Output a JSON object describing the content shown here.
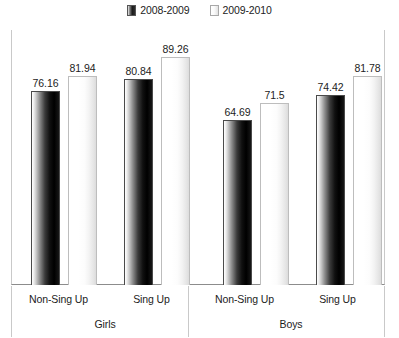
{
  "chart_data": {
    "type": "bar",
    "title": "",
    "subtitle": "",
    "xlabel": "",
    "ylabel": "",
    "grid": false,
    "legend_position": "top-center",
    "ylim": [
      0,
      100
    ],
    "categories": [
      "Non-Sing Up",
      "Sing Up",
      "Non-Sing Up",
      "Sing Up"
    ],
    "group_labels": [
      "Girls",
      "Boys"
    ],
    "series": [
      {
        "name": "2008-2009",
        "color": "#1a1a1a",
        "values": [
          76.16,
          80.84,
          64.69,
          74.42
        ]
      },
      {
        "name": "2009-2010",
        "color": "#f2f2f2",
        "values": [
          81.94,
          89.26,
          71.5,
          81.78
        ]
      }
    ],
    "groups": [
      {
        "label": "Girls",
        "categories": [
          {
            "label": "Non-Sing Up",
            "values": [
              "76.16",
              "81.94"
            ]
          },
          {
            "label": "Sing Up",
            "values": [
              "80.84",
              "89.26"
            ]
          }
        ]
      },
      {
        "label": "Boys",
        "categories": [
          {
            "label": "Non-Sing Up",
            "values": [
              "64.69",
              "71.5"
            ]
          },
          {
            "label": "Sing Up",
            "values": [
              "74.42",
              "81.78"
            ]
          }
        ]
      }
    ]
  },
  "legend": {
    "entries": [
      {
        "label": "2008-2009",
        "swatch": "dark-bar-swatch"
      },
      {
        "label": "2009-2010",
        "swatch": "light-bar-swatch"
      }
    ]
  },
  "bars": [
    {
      "value": "76.16",
      "num": 76.16,
      "series": 0
    },
    {
      "value": "81.94",
      "num": 81.94,
      "series": 1
    },
    {
      "value": "80.84",
      "num": 80.84,
      "series": 0
    },
    {
      "value": "89.26",
      "num": 89.26,
      "series": 1
    },
    {
      "value": "64.69",
      "num": 64.69,
      "series": 0
    },
    {
      "value": "71.5",
      "num": 71.5,
      "series": 1
    },
    {
      "value": "74.42",
      "num": 74.42,
      "series": 0
    },
    {
      "value": "81.78",
      "num": 81.78,
      "series": 1
    }
  ],
  "axis": {
    "row1": [
      "Non-Sing Up",
      "Sing Up",
      "Non-Sing Up",
      "Sing Up"
    ],
    "row2": [
      "Girls",
      "Boys"
    ]
  }
}
